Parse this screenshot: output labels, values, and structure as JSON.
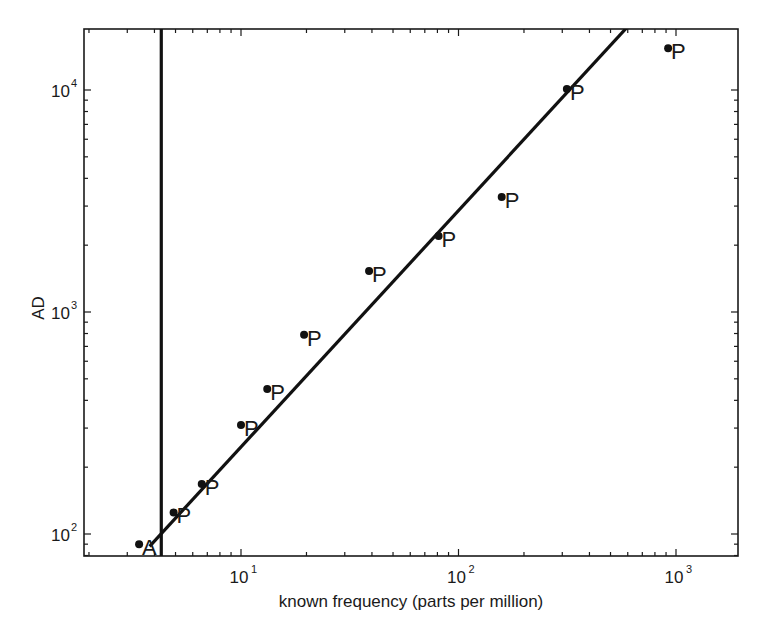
{
  "chart_data": {
    "type": "scatter",
    "title": "",
    "xlabel": "known frequency (parts per million)",
    "ylabel": "AD",
    "xscale": "log",
    "yscale": "log",
    "xlim": [
      2,
      2000
    ],
    "ylim": [
      80,
      20000
    ],
    "grid": false,
    "legend": null,
    "x_ticks": [
      {
        "base": "10",
        "exp": "1",
        "value": 10
      },
      {
        "base": "10",
        "exp": "2",
        "value": 100
      },
      {
        "base": "10",
        "exp": "3",
        "value": 1000
      }
    ],
    "y_ticks": [
      {
        "base": "10",
        "exp": "2",
        "value": 100
      },
      {
        "base": "10",
        "exp": "3",
        "value": 1000
      },
      {
        "base": "10",
        "exp": "4",
        "value": 10000
      }
    ],
    "series": [
      {
        "name": "points",
        "points": [
          {
            "x": 3.4,
            "y": 90,
            "label": "A"
          },
          {
            "x": 4.9,
            "y": 125,
            "label": "P"
          },
          {
            "x": 6.6,
            "y": 168,
            "label": "P"
          },
          {
            "x": 10.0,
            "y": 310,
            "label": "P"
          },
          {
            "x": 13.2,
            "y": 450,
            "label": "P"
          },
          {
            "x": 19.5,
            "y": 790,
            "label": "P"
          },
          {
            "x": 38.8,
            "y": 1530,
            "label": "P"
          },
          {
            "x": 81,
            "y": 2200,
            "label": "P"
          },
          {
            "x": 158,
            "y": 3300,
            "label": "P"
          },
          {
            "x": 315,
            "y": 10100,
            "label": "P"
          },
          {
            "x": 920,
            "y": 15400,
            "label": "P"
          }
        ]
      }
    ],
    "annotations": [
      {
        "type": "fit-line",
        "description": "log-log linear fit",
        "from": {
          "x": 3.8,
          "y": 88
        },
        "to": {
          "x": 620,
          "y": 20000
        }
      },
      {
        "type": "vertical-line",
        "x": 4.3
      }
    ]
  }
}
